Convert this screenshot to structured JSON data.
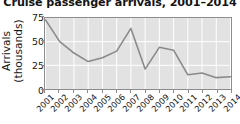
{
  "chart_data": {
    "type": "line",
    "title": "Cruise passenger arrivals, 2001–2014",
    "xlabel": "",
    "ylabel": "Arrivals\n(thousands)",
    "ylabel_line1": "Arrivals",
    "ylabel_line2": "(thousands)",
    "categories": [
      "2001",
      "2002",
      "2003",
      "2004",
      "2005",
      "2006",
      "2007",
      "2008",
      "2009",
      "2010",
      "2011",
      "2012",
      "2013",
      "2014"
    ],
    "values": [
      73,
      50,
      38,
      29,
      33,
      40,
      64,
      21,
      44,
      41,
      15,
      17,
      12,
      13
    ],
    "series": [
      {
        "name": "Cruise passenger arrivals",
        "values": [
          73,
          50,
          38,
          29,
          33,
          40,
          64,
          21,
          44,
          41,
          15,
          17,
          12,
          13
        ]
      }
    ],
    "ylim": [
      0,
      75
    ],
    "yticks": [
      0,
      25,
      50,
      75
    ],
    "ytick_labels": [
      "0",
      "25",
      "50",
      "75"
    ],
    "grid": true,
    "grid_color": "#ffffff",
    "legend": false,
    "legend_position": "none",
    "line_color": "#8a8a8a",
    "plot_background": "#e2e2e2",
    "figure_background": "#ffffff",
    "axis_color": "#8c8c8c"
  }
}
